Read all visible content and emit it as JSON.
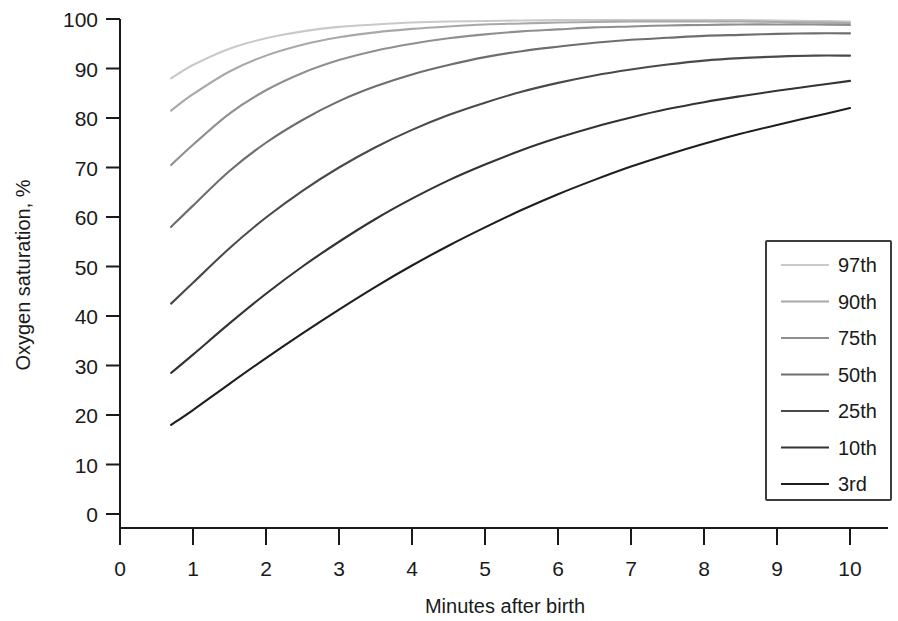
{
  "chart_data": {
    "type": "line",
    "title": "",
    "xlabel": "Minutes after birth",
    "ylabel": "Oxygen saturation, %",
    "xlim": [
      0,
      10
    ],
    "ylim": [
      0,
      100
    ],
    "xticks": [
      0,
      1,
      2,
      3,
      4,
      5,
      6,
      7,
      8,
      9,
      10
    ],
    "xtick_labels": [
      "0",
      "1",
      "2",
      "3",
      "4",
      "5",
      "6",
      "7",
      "8",
      "9",
      "10"
    ],
    "yticks": [
      0,
      10,
      20,
      30,
      40,
      50,
      60,
      70,
      80,
      90,
      100
    ],
    "ytick_labels": [
      "0",
      "10",
      "20",
      "30",
      "40",
      "50",
      "60",
      "70",
      "80",
      "90",
      "100"
    ],
    "grid": false,
    "legend_position": "right-middle",
    "x": [
      0.7,
      1,
      1.5,
      2,
      2.5,
      3,
      3.5,
      4,
      4.5,
      5,
      5.5,
      6,
      6.5,
      7,
      7.5,
      8,
      8.5,
      9,
      9.5,
      10
    ],
    "series": [
      {
        "name": "97th",
        "color": "#c9c9c9",
        "values": [
          88.0,
          90.7,
          94.0,
          96.1,
          97.5,
          98.4,
          98.9,
          99.3,
          99.5,
          99.6,
          99.7,
          99.8,
          99.8,
          99.8,
          99.8,
          99.8,
          99.8,
          99.7,
          99.6,
          99.5
        ]
      },
      {
        "name": "90th",
        "color": "#a8a8a8",
        "values": [
          81.5,
          84.8,
          89.4,
          92.6,
          94.8,
          96.3,
          97.3,
          98.0,
          98.5,
          98.9,
          99.1,
          99.3,
          99.4,
          99.5,
          99.5,
          99.5,
          99.5,
          99.4,
          99.3,
          99.2
        ]
      },
      {
        "name": "75th",
        "color": "#8f8f8f",
        "values": [
          70.5,
          74.6,
          80.9,
          85.6,
          89.1,
          91.7,
          93.6,
          95.0,
          96.1,
          96.9,
          97.5,
          97.9,
          98.3,
          98.5,
          98.7,
          98.8,
          98.9,
          98.9,
          98.9,
          98.8
        ]
      },
      {
        "name": "50th",
        "color": "#6e6e6e",
        "values": [
          58.0,
          62.3,
          69.3,
          75.0,
          79.6,
          83.4,
          86.4,
          88.8,
          90.7,
          92.3,
          93.5,
          94.4,
          95.2,
          95.8,
          96.2,
          96.6,
          96.8,
          97.0,
          97.1,
          97.1
        ]
      },
      {
        "name": "25th",
        "color": "#4a4a4a",
        "values": [
          42.5,
          46.7,
          53.7,
          59.9,
          65.3,
          70.0,
          74.1,
          77.6,
          80.6,
          83.1,
          85.3,
          87.1,
          88.6,
          89.8,
          90.8,
          91.6,
          92.1,
          92.4,
          92.6,
          92.6
        ]
      },
      {
        "name": "10th",
        "color": "#333333",
        "values": [
          28.5,
          32.2,
          38.5,
          44.5,
          50.0,
          55.0,
          59.6,
          63.7,
          67.4,
          70.6,
          73.5,
          76.0,
          78.2,
          80.1,
          81.8,
          83.2,
          84.4,
          85.5,
          86.5,
          87.5
        ]
      },
      {
        "name": "3rd",
        "color": "#1f1f1f",
        "values": [
          18.0,
          21.0,
          26.3,
          31.5,
          36.5,
          41.3,
          45.9,
          50.2,
          54.2,
          57.9,
          61.4,
          64.6,
          67.5,
          70.2,
          72.6,
          74.8,
          76.8,
          78.6,
          80.3,
          82.0
        ]
      }
    ]
  },
  "axes": {
    "y_title": "Oxygen saturation, %",
    "x_title": "Minutes after birth"
  },
  "legend": {
    "entries": [
      {
        "label": "97th"
      },
      {
        "label": "90th"
      },
      {
        "label": "75th"
      },
      {
        "label": "50th"
      },
      {
        "label": "25th"
      },
      {
        "label": "10th"
      },
      {
        "label": "3rd"
      }
    ]
  },
  "ticks": {
    "y": [
      "100",
      "90",
      "80",
      "70",
      "60",
      "50",
      "40",
      "30",
      "20",
      "10",
      "0"
    ],
    "x": [
      "0",
      "1",
      "2",
      "3",
      "4",
      "5",
      "6",
      "7",
      "8",
      "9",
      "10"
    ]
  }
}
